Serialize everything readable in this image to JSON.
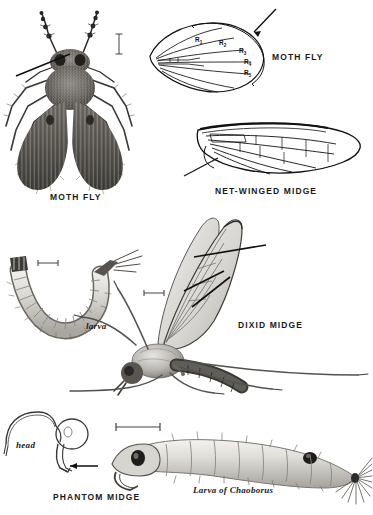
{
  "plate": {
    "title": "Diptera plate: moth flies and midges",
    "background_color": "#ffffff",
    "ink_color": "#1a1a1a",
    "width": 373,
    "height": 515
  },
  "captions": {
    "moth_fly_photo": "MOTH FLY",
    "moth_fly_wing": "MOTH FLY",
    "net_winged_midge": "NET-WINGED MIDGE",
    "dixid_midge": "DIXID MIDGE",
    "phantom_midge": "PHANTOM MIDGE",
    "larva": "larva",
    "head": "head",
    "chaoborus_larva": "Larva of Chaoborus"
  },
  "wing_vein_labels": [
    {
      "text": "R",
      "sub": "1"
    },
    {
      "text": "R",
      "sub": "2"
    },
    {
      "text": "R",
      "sub": "3"
    },
    {
      "text": "R",
      "sub": "4"
    },
    {
      "text": "R",
      "sub": "5"
    }
  ],
  "figures": [
    {
      "name": "moth-fly-photograph",
      "kind": "halftone-photograph",
      "subject": "adult moth fly, dorsal view"
    },
    {
      "name": "moth-fly-wing-diagram",
      "kind": "line-drawing",
      "subject": "moth fly wing venation"
    },
    {
      "name": "net-winged-midge-wing",
      "kind": "line-drawing",
      "subject": "net-winged midge wing"
    },
    {
      "name": "moth-fly-larva",
      "kind": "halftone-drawing",
      "subject": "moth fly larva"
    },
    {
      "name": "dixid-midge-adult",
      "kind": "halftone-drawing",
      "subject": "dixid midge adult, lateral view"
    },
    {
      "name": "phantom-midge-head",
      "kind": "line-drawing",
      "subject": "phantom midge larval head"
    },
    {
      "name": "chaoborus-larva",
      "kind": "halftone-drawing",
      "subject": "Chaoborus larva"
    }
  ],
  "scale_bars": [
    {
      "name": "scale-bar-moth-fly",
      "orientation": "vertical"
    },
    {
      "name": "scale-bar-larva",
      "orientation": "horizontal"
    },
    {
      "name": "scale-bar-dixid-midge",
      "orientation": "horizontal"
    },
    {
      "name": "scale-bar-chaoborus",
      "orientation": "horizontal"
    }
  ],
  "pointers": [
    {
      "name": "pointer-moth-fly-photo",
      "style": "leader-line"
    },
    {
      "name": "pointer-moth-fly-wing",
      "style": "arrow"
    },
    {
      "name": "pointer-net-winged-midge",
      "style": "leader-line"
    },
    {
      "name": "pointer-dixid-wing-upper",
      "style": "leader-line"
    },
    {
      "name": "pointer-dixid-wing-lower",
      "style": "leader-line"
    },
    {
      "name": "pointer-phantom-head",
      "style": "arrow"
    }
  ]
}
